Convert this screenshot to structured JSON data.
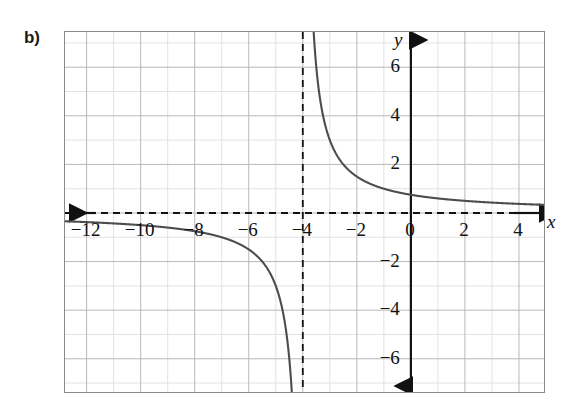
{
  "figure": {
    "part_label": "b)",
    "x_axis_name": "x",
    "y_axis_name": "y"
  },
  "colors": {
    "curve": "#4d4d4d",
    "axis": "#111111",
    "asymptote": "#111111",
    "grid_major": "#b8b8b8",
    "grid_minor": "#e2e2e2",
    "frame": "#8a8a8a",
    "text": "#111111",
    "background": "#ffffff"
  },
  "chart_data": {
    "type": "line",
    "title": "",
    "xlabel": "x",
    "ylabel": "y",
    "function": "y = 3/(x + 4)",
    "xlim": [
      -12.8,
      5.0
    ],
    "ylim": [
      -7.45,
      7.45
    ],
    "grid": true,
    "grid_major_step": 2,
    "grid_minor_step": 1,
    "legend": "none",
    "asymptotes": {
      "vertical": [
        -4
      ],
      "horizontal": [
        0
      ]
    },
    "x_tick_labels": [
      "-12",
      "-10",
      "-8",
      "-6",
      "-4",
      "-2",
      "0",
      "2",
      "4"
    ],
    "x_ticks": [
      -12,
      -10,
      -8,
      -6,
      -4,
      -2,
      0,
      2,
      4
    ],
    "y_tick_labels": [
      "6",
      "4",
      "2",
      "-2",
      "-4",
      "-6"
    ],
    "y_ticks": [
      6,
      4,
      2,
      -2,
      -4,
      -6
    ],
    "series": [
      {
        "name": "left-branch",
        "x": [
          -12.8,
          -12,
          -11,
          -10,
          -9,
          -8,
          -7,
          -6.5,
          -6,
          -5.5,
          -5.2,
          -5.0,
          -4.8,
          -4.6,
          -4.45,
          -4.35,
          -4.28,
          -4.22,
          -4.18,
          -4.15
        ],
        "y": [
          -0.34,
          -0.375,
          -0.43,
          -0.5,
          -0.6,
          -0.75,
          -1.0,
          -1.2,
          -1.5,
          -2.0,
          -2.5,
          -3.0,
          -3.75,
          -5.0,
          -5.45,
          -8.57,
          -10.7,
          -13.6,
          -16.7,
          -20.0
        ]
      },
      {
        "name": "right-branch",
        "x": [
          -3.8,
          -3.75,
          -3.7,
          -3.65,
          -3.6,
          -3.5,
          -3.4,
          -3.25,
          -3.0,
          -2.75,
          -2.5,
          -2.0,
          -1.5,
          -1.0,
          -0.5,
          0,
          1,
          2,
          3,
          4,
          5
        ],
        "y": [
          15.0,
          12.0,
          10.0,
          8.57,
          7.5,
          6.0,
          5.0,
          4.0,
          3.0,
          2.4,
          2.0,
          1.5,
          1.2,
          1.0,
          0.857,
          0.75,
          0.6,
          0.5,
          0.429,
          0.375,
          0.333
        ]
      }
    ]
  }
}
